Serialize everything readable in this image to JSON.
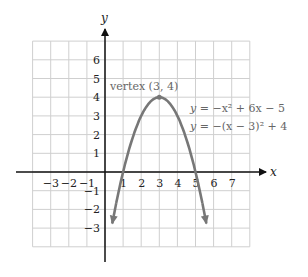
{
  "chart_data": {
    "type": "line",
    "title": "",
    "xlabel": "x",
    "ylabel": "y",
    "xlim": [
      -4,
      8
    ],
    "ylim": [
      -4,
      7
    ],
    "grid": true,
    "x_ticks": [
      "-3",
      "-2",
      "-1",
      "1",
      "2",
      "3",
      "4",
      "5",
      "6",
      "7"
    ],
    "y_ticks": [
      "6",
      "5",
      "4",
      "3",
      "2",
      "1",
      "-1",
      "-2",
      "-3"
    ],
    "series": [
      {
        "name": "y = -x^2 + 6x - 5",
        "equation_standard": "y = −x² + 6x − 5",
        "equation_vertex": "y = −(x − 3)² + 4",
        "x": [
          0.45,
          1,
          2,
          3,
          4,
          5,
          5.55
        ],
        "y": [
          -2.5,
          0,
          3,
          4,
          3,
          0,
          -2.5
        ],
        "color": "#777777"
      }
    ],
    "annotations": [
      {
        "text": "vertex (3, 4)",
        "x": 3,
        "y": 4
      },
      {
        "text": "y = −x² + 6x − 5"
      },
      {
        "text": "y = −(x − 3)² + 4"
      }
    ]
  },
  "labels": {
    "x_axis": "x",
    "y_axis": "y",
    "vertex": "vertex (3, 4)",
    "eq1_lhs": "y",
    "eq1_rhs": " = −x² + 6x − 5",
    "eq2_lhs": "y",
    "eq2_rhs": " = −(x − 3)² + 4"
  }
}
